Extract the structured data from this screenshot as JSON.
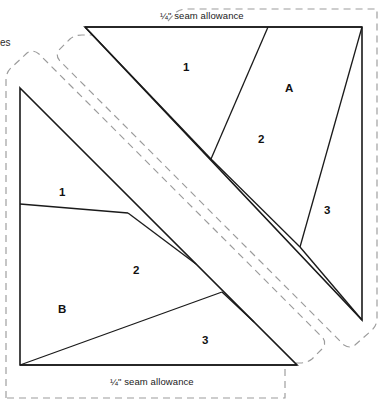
{
  "page": {
    "width": 390,
    "height": 408,
    "background": "#ffffff",
    "kind": "quilt-paper-piecing-template"
  },
  "colors": {
    "solid_line": "#1a1a1a",
    "dashed_line": "#9b9b9b",
    "text": "#111111",
    "background": "#ffffff"
  },
  "labels": {
    "seam_allowance_top": "¼\" seam allowance",
    "seam_allowance_bottom": "¼\" seam allowance",
    "cut_off_left_text": "es"
  },
  "templates": [
    {
      "id": "A",
      "name": "template-a",
      "letter": "A",
      "sections": [
        "1",
        "2",
        "3"
      ],
      "outline": [
        [
          85,
          27
        ],
        [
          362,
          27
        ],
        [
          362,
          320
        ]
      ],
      "description": "Upper-right triangle template with three numbered piecing sections"
    },
    {
      "id": "B",
      "name": "template-b",
      "letter": "B",
      "sections": [
        "1",
        "2",
        "3"
      ],
      "outline": [
        [
          20,
          88
        ],
        [
          297,
          365
        ],
        [
          20,
          365
        ]
      ],
      "description": "Lower-left triangle template with three numbered piecing sections"
    }
  ],
  "piece_labels": [
    {
      "text": "1",
      "template": "A",
      "x": 186,
      "y": 68
    },
    {
      "text": "A",
      "template": "A",
      "x": 289,
      "y": 89
    },
    {
      "text": "2",
      "template": "A",
      "x": 261,
      "y": 140
    },
    {
      "text": "3",
      "template": "A",
      "x": 327,
      "y": 211
    },
    {
      "text": "1",
      "template": "B",
      "x": 62,
      "y": 193
    },
    {
      "text": "2",
      "template": "B",
      "x": 136,
      "y": 271
    },
    {
      "text": "B",
      "template": "B",
      "x": 61,
      "y": 310
    },
    {
      "text": "3",
      "template": "B",
      "x": 205,
      "y": 341
    }
  ],
  "geometry": {
    "template_a": {
      "top_left": [
        85,
        27
      ],
      "top_right": [
        362,
        27
      ],
      "bottom": [
        362,
        320
      ],
      "seam_lines": [
        {
          "from": [
            85,
            27
          ],
          "to": [
            211,
            159
          ],
          "name": "a-seam-1-2"
        },
        {
          "from": [
            211,
            159
          ],
          "to": [
            268,
            27
          ],
          "name": "a-seam-1-2-upper"
        },
        {
          "from": [
            211,
            159
          ],
          "to": [
            300,
            247
          ],
          "name": "a-seam-2-3-lower"
        },
        {
          "from": [
            300,
            247
          ],
          "to": [
            362,
            27
          ],
          "name": "a-seam-2-3"
        }
      ]
    },
    "template_b": {
      "top": [
        20,
        88
      ],
      "bottom_left": [
        20,
        365
      ],
      "bottom_right": [
        297,
        365
      ],
      "seam_lines": [
        {
          "from": [
            20,
            204
          ],
          "to": [
            128,
            213
          ],
          "name": "b-seam-1-2"
        },
        {
          "from": [
            128,
            213
          ],
          "to": [
            159,
            222
          ],
          "name": "b-seam-1-2-edge"
        },
        {
          "from": [
            20,
            365
          ],
          "to": [
            222,
            292
          ],
          "name": "b-seam-2-3"
        },
        {
          "from": [
            222,
            292
          ],
          "to": [
            254,
            322
          ],
          "name": "b-seam-2-3-edge"
        }
      ]
    }
  },
  "seam_allowance_outlines": {
    "template_a_dashed": "M 78 22 L 78 14 Q 79 9 85 9 L 375 9 L 375 330 Q 375 336 369 337 L 355 337 L 350 342",
    "template_b_dashed": "M 8 82 L 8 392 L 300 392 L 315 380 L 330 372",
    "note": "Dashed grey offset outlines indicating the 1/4 inch seam allowance boundary around each triangular template"
  }
}
